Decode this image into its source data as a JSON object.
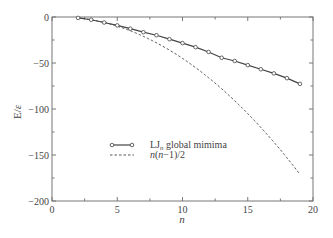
{
  "chart_data": {
    "type": "line",
    "title": "",
    "xlabel": "n",
    "ylabel": "E/ε",
    "xlim": [
      0,
      20
    ],
    "ylim": [
      -200,
      0
    ],
    "xticks": [
      0,
      5,
      10,
      15,
      20
    ],
    "yticks": [
      0,
      -50,
      -100,
      -150,
      -200
    ],
    "grid": false,
    "legend_position": "center-right",
    "series": [
      {
        "name": "LJn global mimima",
        "style": "solid line with open circle markers",
        "x": [
          2,
          3,
          4,
          5,
          6,
          7,
          8,
          9,
          10,
          11,
          12,
          13,
          14,
          15,
          16,
          17,
          18,
          19
        ],
        "values": [
          -1.0,
          -3.0,
          -6.0,
          -9.1,
          -12.7,
          -16.5,
          -19.8,
          -24.1,
          -28.4,
          -32.8,
          -38.0,
          -44.3,
          -47.8,
          -52.3,
          -56.8,
          -61.3,
          -66.5,
          -72.7
        ]
      },
      {
        "name": "n(n−1)/2",
        "style": "dashed line",
        "x": [
          2,
          3,
          4,
          5,
          6,
          7,
          8,
          9,
          10,
          11,
          12,
          13,
          14,
          15,
          16,
          17,
          18,
          19
        ],
        "values": [
          -1,
          -3,
          -6,
          -10,
          -15,
          -21,
          -28,
          -36,
          -45,
          -55,
          -66,
          -78,
          -91,
          -105,
          -120,
          -136,
          -153,
          -171
        ]
      }
    ]
  },
  "axes": {
    "ylabel_main": "E",
    "ylabel_sep": "/",
    "ylabel_eps": "ε",
    "xlabel": "n",
    "xtick_labels": [
      "0",
      "5",
      "10",
      "15",
      "20"
    ],
    "ytick_labels": [
      "0",
      "−50",
      "−100",
      "−150",
      "−200"
    ]
  },
  "legend": {
    "item1_main": "LJ",
    "item1_sub": "n",
    "item1_rest": " global mimima",
    "item2_n1": "n",
    "item2_p1": "(",
    "item2_n2": "n",
    "item2_rest": "−1)/2"
  }
}
